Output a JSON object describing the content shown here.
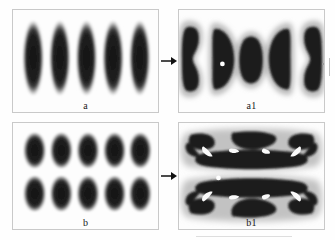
{
  "figure": {
    "caption_panels": [
      "a",
      "a1",
      "b",
      "b1"
    ],
    "background_color": "#fefefe",
    "panel_border_color": "#c9c9c9",
    "blob_core_color": "#1b1b1b",
    "blob_halo_color": "#f2f2f2",
    "marker_color": "#ffffff",
    "arrow_color": "#111111"
  },
  "panels": [
    {
      "id": "a",
      "label": "a",
      "role": "initial-state-vertical-stripes",
      "description": "Five elongated vertical dark ellipses arranged in a single row, each surrounded by a light diffuse halo",
      "object_count": 5,
      "rows": 1,
      "columns": 5,
      "orientation": "vertical"
    },
    {
      "id": "a1",
      "label": "a1",
      "role": "transformed-state-vertical-stripes",
      "description": "Five deformed domains: outer two pinched into hourglass shapes, inner pair crescent or D-shaped, centre one a compact ellipse",
      "object_count": 5,
      "rows": 1,
      "columns": 5,
      "orientation": "vertical",
      "marker": {
        "type": "white-dot",
        "present": true,
        "count": 1
      }
    },
    {
      "id": "b",
      "label": "b",
      "role": "initial-state-dot-lattice",
      "description": "Ten dark rounded-rectangular domains in a five by two lattice, each with a light halo",
      "object_count": 10,
      "rows": 2,
      "columns": 5,
      "orientation": "vertical"
    },
    {
      "id": "b1",
      "label": "b1",
      "role": "transformed-state-dot-lattice",
      "description": "Two merged horizontal band structures, each with bright sinuous channels separating dark lobes",
      "object_count": 2,
      "rows": 2,
      "columns": 1,
      "orientation": "horizontal",
      "marker": {
        "type": "white-dot",
        "present": true,
        "count": 1
      }
    }
  ],
  "arrows": [
    {
      "id": "arrow-a",
      "from": "a",
      "to": "a1",
      "direction": "right"
    },
    {
      "id": "arrow-b",
      "from": "b",
      "to": "b1",
      "direction": "right"
    }
  ]
}
